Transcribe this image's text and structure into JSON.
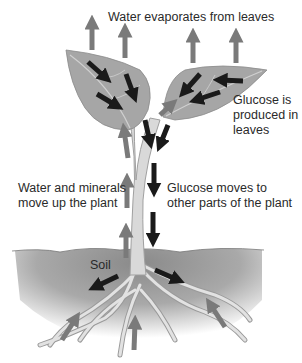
{
  "diagram": {
    "type": "plant-transport",
    "colors": {
      "background": "#ffffff",
      "leaf": "#a6a6a6",
      "leaf_vein": "#d4d4d4",
      "stem": "#d9d9d9",
      "stem_outline": "#a0a0a0",
      "soil_dark": "#8c8c8c",
      "soil_light": "#ffffff",
      "water_arrow": "#7a7a7a",
      "glucose_arrow": "#1a1a1a",
      "text": "#2a2a2a"
    },
    "labels": {
      "evaporation": "Water evaporates from leaves",
      "glucose_produced": [
        "Glucose is",
        "produced in",
        "leaves"
      ],
      "water_up": [
        "Water and minerals",
        "move up the plant"
      ],
      "glucose_moves": [
        "Glucose moves to",
        "other parts of the plant"
      ],
      "soil": "Soil"
    },
    "legend": {
      "water_arrows": "gray arrows = water movement",
      "glucose_arrows": "black arrows = glucose movement"
    }
  }
}
